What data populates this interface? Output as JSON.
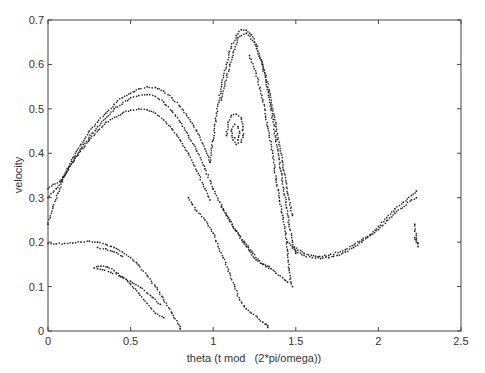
{
  "chart_data": {
    "type": "scatter",
    "title": "",
    "xlabel": "theta (t mod   (2*pi/omega))",
    "ylabel": "velocity",
    "xlim": [
      0,
      2.5
    ],
    "ylim": [
      0,
      0.7
    ],
    "xticks": [
      0,
      0.5,
      1,
      1.5,
      2,
      2.5
    ],
    "xtick_labels": [
      "0",
      "0.5",
      "1",
      "1.5",
      "2",
      "2.5"
    ],
    "yticks": [
      0,
      0.1,
      0.2,
      0.3,
      0.4,
      0.5,
      0.6,
      0.7
    ],
    "ytick_labels": [
      "0",
      "0.1",
      "0.2",
      "0.3",
      "0.4",
      "0.5",
      "0.6",
      "0.7"
    ],
    "grid": false,
    "legend": null,
    "marker_color": "#1a1a1a",
    "series": [
      {
        "name": "main arch outer",
        "points": [
          [
            0.0,
            0.24
          ],
          [
            0.03,
            0.28
          ],
          [
            0.06,
            0.31
          ],
          [
            0.1,
            0.35
          ],
          [
            0.15,
            0.39
          ],
          [
            0.2,
            0.42
          ],
          [
            0.25,
            0.45
          ],
          [
            0.3,
            0.47
          ],
          [
            0.35,
            0.49
          ],
          [
            0.4,
            0.51
          ],
          [
            0.45,
            0.525
          ],
          [
            0.5,
            0.535
          ],
          [
            0.55,
            0.545
          ],
          [
            0.6,
            0.55
          ],
          [
            0.65,
            0.548
          ],
          [
            0.7,
            0.54
          ],
          [
            0.75,
            0.525
          ],
          [
            0.8,
            0.505
          ],
          [
            0.85,
            0.48
          ],
          [
            0.9,
            0.45
          ],
          [
            0.95,
            0.41
          ],
          [
            0.98,
            0.38
          ]
        ]
      },
      {
        "name": "main arch middle",
        "points": [
          [
            0.0,
            0.3
          ],
          [
            0.05,
            0.32
          ],
          [
            0.1,
            0.35
          ],
          [
            0.2,
            0.41
          ],
          [
            0.3,
            0.46
          ],
          [
            0.4,
            0.5
          ],
          [
            0.5,
            0.525
          ],
          [
            0.55,
            0.53
          ],
          [
            0.6,
            0.532
          ],
          [
            0.65,
            0.528
          ],
          [
            0.7,
            0.515
          ],
          [
            0.75,
            0.495
          ],
          [
            0.8,
            0.47
          ],
          [
            0.85,
            0.44
          ],
          [
            0.9,
            0.405
          ],
          [
            0.95,
            0.365
          ],
          [
            1.0,
            0.32
          ]
        ]
      },
      {
        "name": "main arch inner",
        "points": [
          [
            0.0,
            0.32
          ],
          [
            0.08,
            0.34
          ],
          [
            0.15,
            0.38
          ],
          [
            0.25,
            0.43
          ],
          [
            0.35,
            0.47
          ],
          [
            0.45,
            0.49
          ],
          [
            0.5,
            0.497
          ],
          [
            0.55,
            0.5
          ],
          [
            0.6,
            0.498
          ],
          [
            0.65,
            0.49
          ],
          [
            0.7,
            0.475
          ],
          [
            0.75,
            0.455
          ],
          [
            0.8,
            0.43
          ],
          [
            0.85,
            0.4
          ],
          [
            0.9,
            0.36
          ],
          [
            0.95,
            0.32
          ],
          [
            0.98,
            0.295
          ]
        ]
      },
      {
        "name": "left lobe upper",
        "points": [
          [
            0.0,
            0.197
          ],
          [
            0.05,
            0.196
          ],
          [
            0.1,
            0.197
          ],
          [
            0.15,
            0.198
          ],
          [
            0.2,
            0.2
          ],
          [
            0.25,
            0.202
          ],
          [
            0.3,
            0.2
          ],
          [
            0.35,
            0.195
          ],
          [
            0.4,
            0.188
          ],
          [
            0.45,
            0.178
          ],
          [
            0.5,
            0.165
          ],
          [
            0.55,
            0.148
          ],
          [
            0.6,
            0.125
          ],
          [
            0.65,
            0.1
          ],
          [
            0.7,
            0.07
          ],
          [
            0.75,
            0.04
          ],
          [
            0.8,
            0.01
          ]
        ]
      },
      {
        "name": "left lobe lower",
        "points": [
          [
            0.28,
            0.142
          ],
          [
            0.32,
            0.146
          ],
          [
            0.36,
            0.144
          ],
          [
            0.4,
            0.136
          ],
          [
            0.45,
            0.122
          ],
          [
            0.5,
            0.105
          ],
          [
            0.55,
            0.085
          ],
          [
            0.6,
            0.062
          ],
          [
            0.65,
            0.04
          ],
          [
            0.7,
            0.03
          ],
          [
            0.3,
            0.188
          ],
          [
            0.35,
            0.185
          ],
          [
            0.4,
            0.178
          ],
          [
            0.45,
            0.168
          ]
        ]
      },
      {
        "name": "left lobe inner hook",
        "points": [
          [
            0.3,
            0.14
          ],
          [
            0.33,
            0.138
          ],
          [
            0.38,
            0.132
          ],
          [
            0.44,
            0.122
          ],
          [
            0.5,
            0.112
          ],
          [
            0.56,
            0.098
          ],
          [
            0.62,
            0.08
          ],
          [
            0.68,
            0.06
          ]
        ]
      },
      {
        "name": "tall loop",
        "points": [
          [
            0.98,
            0.38
          ],
          [
            1.0,
            0.43
          ],
          [
            1.02,
            0.49
          ],
          [
            1.05,
            0.55
          ],
          [
            1.08,
            0.6
          ],
          [
            1.11,
            0.64
          ],
          [
            1.14,
            0.665
          ],
          [
            1.17,
            0.678
          ],
          [
            1.2,
            0.677
          ],
          [
            1.23,
            0.667
          ],
          [
            1.26,
            0.645
          ],
          [
            1.29,
            0.61
          ],
          [
            1.32,
            0.56
          ],
          [
            1.35,
            0.5
          ],
          [
            1.38,
            0.43
          ],
          [
            1.41,
            0.36
          ],
          [
            1.44,
            0.29
          ],
          [
            1.46,
            0.24
          ],
          [
            1.48,
            0.2
          ],
          [
            1.5,
            0.175
          ]
        ]
      },
      {
        "name": "tall loop inner",
        "points": [
          [
            1.05,
            0.52
          ],
          [
            1.1,
            0.6
          ],
          [
            1.15,
            0.66
          ],
          [
            1.2,
            0.67
          ],
          [
            1.25,
            0.65
          ],
          [
            1.3,
            0.6
          ],
          [
            1.34,
            0.54
          ],
          [
            1.38,
            0.46
          ],
          [
            1.42,
            0.38
          ],
          [
            1.45,
            0.31
          ],
          [
            1.48,
            0.26
          ]
        ]
      },
      {
        "name": "tall loop right falling",
        "points": [
          [
            1.22,
            0.62
          ],
          [
            1.26,
            0.58
          ],
          [
            1.3,
            0.52
          ],
          [
            1.33,
            0.46
          ],
          [
            1.36,
            0.4
          ],
          [
            1.38,
            0.34
          ],
          [
            1.4,
            0.3
          ],
          [
            1.42,
            0.26
          ],
          [
            1.44,
            0.22
          ],
          [
            1.45,
            0.18
          ],
          [
            1.46,
            0.14
          ],
          [
            1.47,
            0.11
          ],
          [
            1.48,
            0.1
          ]
        ]
      },
      {
        "name": "small spiral",
        "points": [
          [
            1.08,
            0.44
          ],
          [
            1.09,
            0.47
          ],
          [
            1.11,
            0.485
          ],
          [
            1.14,
            0.488
          ],
          [
            1.17,
            0.48
          ],
          [
            1.18,
            0.46
          ],
          [
            1.18,
            0.44
          ],
          [
            1.17,
            0.425
          ],
          [
            1.14,
            0.42
          ],
          [
            1.12,
            0.43
          ],
          [
            1.11,
            0.45
          ],
          [
            1.13,
            0.465
          ],
          [
            1.15,
            0.46
          ],
          [
            1.16,
            0.445
          ],
          [
            1.15,
            0.43
          ],
          [
            1.13,
            0.435
          ]
        ]
      },
      {
        "name": "descending diagonal",
        "points": [
          [
            1.0,
            0.32
          ],
          [
            1.04,
            0.29
          ],
          [
            1.08,
            0.26
          ],
          [
            1.12,
            0.235
          ],
          [
            1.16,
            0.215
          ],
          [
            1.2,
            0.195
          ],
          [
            1.24,
            0.175
          ],
          [
            1.28,
            0.158
          ],
          [
            1.32,
            0.145
          ],
          [
            1.35,
            0.14
          ],
          [
            1.38,
            0.13
          ],
          [
            1.42,
            0.12
          ],
          [
            1.45,
            0.11
          ]
        ]
      },
      {
        "name": "descending diagonal 2",
        "points": [
          [
            1.05,
            0.28
          ],
          [
            1.1,
            0.25
          ],
          [
            1.14,
            0.225
          ],
          [
            1.18,
            0.2
          ],
          [
            1.22,
            0.18
          ],
          [
            1.26,
            0.16
          ],
          [
            1.3,
            0.15
          ],
          [
            1.34,
            0.145
          ]
        ]
      },
      {
        "name": "scattered tail",
        "points": [
          [
            0.85,
            0.3
          ],
          [
            0.9,
            0.27
          ],
          [
            0.95,
            0.25
          ],
          [
            1.0,
            0.22
          ],
          [
            1.03,
            0.19
          ],
          [
            1.06,
            0.165
          ],
          [
            1.1,
            0.13
          ],
          [
            1.13,
            0.1
          ],
          [
            1.16,
            0.07
          ],
          [
            1.2,
            0.05
          ],
          [
            1.3,
            0.02
          ],
          [
            1.33,
            0.012
          ]
        ]
      },
      {
        "name": "valley and right rise",
        "points": [
          [
            1.45,
            0.2
          ],
          [
            1.5,
            0.18
          ],
          [
            1.55,
            0.17
          ],
          [
            1.6,
            0.165
          ],
          [
            1.65,
            0.163
          ],
          [
            1.7,
            0.165
          ],
          [
            1.75,
            0.17
          ],
          [
            1.8,
            0.178
          ],
          [
            1.85,
            0.188
          ],
          [
            1.9,
            0.2
          ],
          [
            1.95,
            0.215
          ],
          [
            2.0,
            0.235
          ],
          [
            2.05,
            0.255
          ],
          [
            2.1,
            0.275
          ],
          [
            2.15,
            0.29
          ],
          [
            2.2,
            0.305
          ],
          [
            2.23,
            0.315
          ]
        ]
      },
      {
        "name": "valley and right rise 2",
        "points": [
          [
            1.48,
            0.19
          ],
          [
            1.55,
            0.175
          ],
          [
            1.62,
            0.168
          ],
          [
            1.7,
            0.17
          ],
          [
            1.8,
            0.183
          ],
          [
            1.9,
            0.205
          ],
          [
            2.0,
            0.228
          ],
          [
            2.1,
            0.265
          ],
          [
            2.2,
            0.295
          ],
          [
            2.23,
            0.3
          ]
        ]
      },
      {
        "name": "right cluster",
        "points": [
          [
            2.22,
            0.24
          ],
          [
            2.22,
            0.225
          ],
          [
            2.23,
            0.215
          ],
          [
            2.23,
            0.205
          ],
          [
            2.24,
            0.198
          ],
          [
            2.24,
            0.19
          ],
          [
            2.23,
            0.2
          ],
          [
            2.22,
            0.21
          ]
        ]
      },
      {
        "name": "isolated points",
        "points": [
          [
            0.8,
            0.005
          ],
          [
            1.32,
            0.015
          ],
          [
            1.33,
            0.008
          ]
        ]
      }
    ]
  }
}
